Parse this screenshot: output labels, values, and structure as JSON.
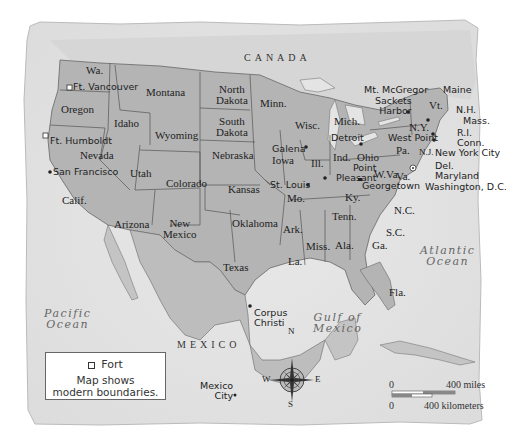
{
  "map": {
    "colors": {
      "paper": "#e6e6e6",
      "land_us": "#b4b4b4",
      "land_other": "#c8c8c8",
      "water": "#e2e2e2",
      "border": "#555555"
    },
    "countries": {
      "canada": "CANADA",
      "mexico": "MEXICO"
    },
    "water_bodies": {
      "pacific": "Pacific Ocean",
      "pacific_l1": "Pacific",
      "pacific_l2": "Ocean",
      "atlantic_l1": "Atlantic",
      "atlantic_l2": "Ocean",
      "gulf_l1": "Gulf of",
      "gulf_l2": "Mexico"
    },
    "states": {
      "wa": "Wa.",
      "oregon": "Oregon",
      "calif": "Calif.",
      "idaho": "Idaho",
      "nevada": "Nevada",
      "montana": "Montana",
      "wyoming": "Wyoming",
      "utah": "Utah",
      "arizona": "Arizona",
      "colorado": "Colorado",
      "new_mexico_l1": "New",
      "new_mexico_l2": "Mexico",
      "north_dakota_l1": "North",
      "north_dakota_l2": "Dakota",
      "south_dakota_l1": "South",
      "south_dakota_l2": "Dakota",
      "nebraska": "Nebraska",
      "kansas": "Kansas",
      "oklahoma": "Oklahoma",
      "texas": "Texas",
      "minn": "Minn.",
      "iowa": "Iowa",
      "mo": "Mo.",
      "ark": "Ark.",
      "la": "La.",
      "wisc": "Wisc.",
      "ill": "Ill.",
      "mich": "Mich.",
      "ind": "Ind.",
      "ohio": "Ohio",
      "ky": "Ky.",
      "tenn": "Tenn.",
      "miss": "Miss.",
      "ala": "Ala.",
      "ga": "Ga.",
      "fla": "Fla.",
      "sc": "S.C.",
      "nc": "N.C.",
      "va": "Va.",
      "wva": "W.Va.",
      "pa": "Pa.",
      "ny": "N.Y.",
      "nj": "N.J.",
      "vt": "Vt.",
      "maine": "Maine",
      "nh": "N.H.",
      "mass": "Mass.",
      "ri": "R.I.",
      "conn": "Conn.",
      "del": "Del.",
      "maryland": "Maryland"
    },
    "places": {
      "ft_vancouver": "Ft. Vancouver",
      "ft_humboldt": "Ft. Humboldt",
      "san_francisco": "San Francisco",
      "galena": "Galena",
      "st_louis": "St. Louis",
      "point_pleasant_l1": "Point",
      "point_pleasant_l2": "Pleasant",
      "detroit": "Detroit",
      "georgetown": "Georgetown",
      "mt_mcgregor": "Mt. McGregor",
      "sackets_harbor_l1": "Sackets",
      "sackets_harbor_l2": "Harbor",
      "west_point": "West Point",
      "new_york_city": "New York City",
      "washington_dc": "Washington, D.C.",
      "corpus_christi_l1": "Corpus",
      "corpus_christi_l2": "Christi",
      "mexico_city_l1": "Mexico",
      "mexico_city_l2": "City"
    },
    "compass": {
      "n": "N",
      "s": "S",
      "e": "E",
      "w": "W"
    },
    "legend": {
      "fort_label": "Fort",
      "note_l1": "Map shows",
      "note_l2": "modern boundaries."
    },
    "scale": {
      "miles_zero": "0",
      "miles_label": "400 miles",
      "km_zero": "0",
      "km_label": "400 kilometers"
    }
  }
}
